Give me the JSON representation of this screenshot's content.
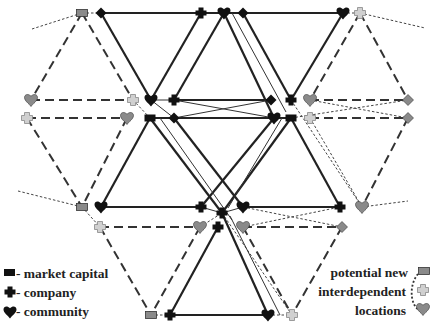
{
  "diagram": {
    "type": "network",
    "colors": {
      "solid_node": "#1a1a1a",
      "potential_node_dark": "#8a8a8a",
      "potential_node_light": "#cfcfcf",
      "solid_edge": "#2a2a2a",
      "dashed_edge": "#3a3a3a"
    }
  },
  "legend_left": {
    "items": [
      {
        "icon": "market-capital-icon",
        "label": "- market capital"
      },
      {
        "icon": "company-icon",
        "label": "- company"
      },
      {
        "icon": "community-icon",
        "label": "- community"
      }
    ]
  },
  "legend_right": {
    "lines": [
      "potential new",
      "interdependent",
      "locations"
    ],
    "icons": [
      "potential-market-capital-icon",
      "potential-company-icon",
      "potential-community-icon"
    ]
  }
}
